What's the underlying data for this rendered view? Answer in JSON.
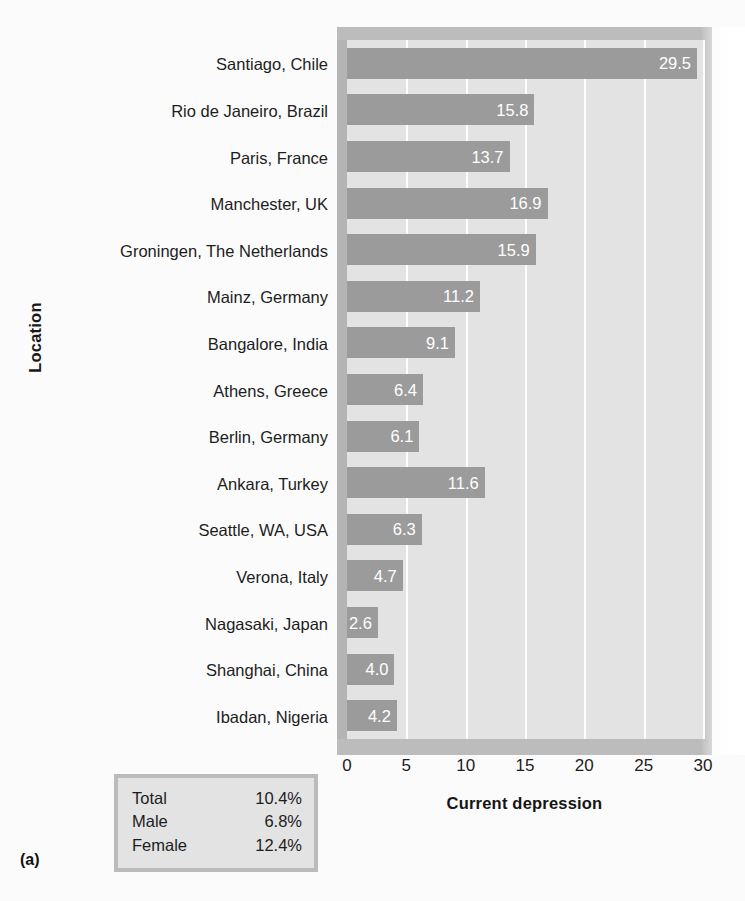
{
  "figure": {
    "panel_label": "(a)",
    "y_axis_title": "Location",
    "x_axis_title": "Current depression"
  },
  "summary": {
    "rows": [
      {
        "label": "Total",
        "value": "10.4%"
      },
      {
        "label": "Male",
        "value": "6.8%"
      },
      {
        "label": "Female",
        "value": "12.4%"
      }
    ]
  },
  "chart_data": {
    "type": "bar",
    "orientation": "horizontal",
    "title": "",
    "xlabel": "Current depression",
    "ylabel": "Location",
    "xlim": [
      0,
      30
    ],
    "xticks": [
      0,
      5,
      10,
      15,
      20,
      25,
      30
    ],
    "xtick_labels": [
      "0",
      "5",
      "10",
      "15",
      "20",
      "25",
      "30"
    ],
    "grid": "vertical-white",
    "legend": "none",
    "bar_color": "#9b9b9b",
    "plot_background": "#e3e3e3",
    "value_label_color": "#ffffff",
    "categories": [
      "Santiago, Chile",
      "Rio de Janeiro, Brazil",
      "Paris, France",
      "Manchester, UK",
      "Groningen, The Netherlands",
      "Mainz, Germany",
      "Bangalore, India",
      "Athens, Greece",
      "Berlin, Germany",
      "Ankara, Turkey",
      "Seattle, WA, USA",
      "Verona, Italy",
      "Nagasaki, Japan",
      "Shanghai, China",
      "Ibadan, Nigeria"
    ],
    "values": [
      29.5,
      15.8,
      13.7,
      16.9,
      15.9,
      11.2,
      9.1,
      6.4,
      6.1,
      11.6,
      6.3,
      4.7,
      2.6,
      4.0,
      4.2
    ],
    "value_labels": [
      "29.5",
      "15.8",
      "13.7",
      "16.9",
      "15.9",
      "11.2",
      "9.1",
      "6.4",
      "6.1",
      "11.6",
      "6.3",
      "4.7",
      "2.6",
      "4.0",
      "4.2"
    ]
  }
}
